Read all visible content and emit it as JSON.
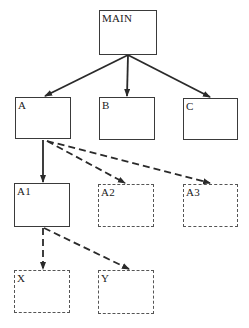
{
  "diagram": {
    "type": "hierarchy",
    "nodes": [
      {
        "id": "main",
        "label": "MAIN",
        "style": "solid",
        "x": 99,
        "y": 10,
        "w": 58,
        "h": 45
      },
      {
        "id": "a",
        "label": "A",
        "style": "solid",
        "x": 15,
        "y": 97,
        "w": 56,
        "h": 42
      },
      {
        "id": "b",
        "label": "B",
        "style": "solid",
        "x": 99,
        "y": 97,
        "w": 56,
        "h": 43
      },
      {
        "id": "c",
        "label": "C",
        "style": "solid",
        "x": 183,
        "y": 98,
        "w": 55,
        "h": 42
      },
      {
        "id": "a1",
        "label": "A1",
        "style": "solid",
        "x": 14,
        "y": 183,
        "w": 56,
        "h": 44
      },
      {
        "id": "a2",
        "label": "A2",
        "style": "dashed",
        "x": 98,
        "y": 184,
        "w": 56,
        "h": 43
      },
      {
        "id": "a3",
        "label": "A3",
        "style": "dashed",
        "x": 183,
        "y": 184,
        "w": 55,
        "h": 43
      },
      {
        "id": "x",
        "label": "X",
        "style": "dashed",
        "x": 14,
        "y": 270,
        "w": 56,
        "h": 43
      },
      {
        "id": "y",
        "label": "Y",
        "style": "dashed",
        "x": 98,
        "y": 270,
        "w": 56,
        "h": 44
      }
    ],
    "edges": [
      {
        "from": "main",
        "to": "a",
        "style": "solid"
      },
      {
        "from": "main",
        "to": "b",
        "style": "solid"
      },
      {
        "from": "main",
        "to": "c",
        "style": "solid"
      },
      {
        "from": "a",
        "to": "a1",
        "style": "solid"
      },
      {
        "from": "a",
        "to": "a2",
        "style": "dashed"
      },
      {
        "from": "a",
        "to": "a3",
        "style": "dashed"
      },
      {
        "from": "a1",
        "to": "x",
        "style": "dashed"
      },
      {
        "from": "a1",
        "to": "y",
        "style": "dashed"
      }
    ]
  },
  "labels": {
    "main": "MAIN",
    "a": "A",
    "b": "B",
    "c": "C",
    "a1": "A1",
    "a2": "A2",
    "a3": "A3",
    "x": "X",
    "y": "Y"
  },
  "colors": {
    "line": "#2a2a2a",
    "dashed_border": "#555555",
    "background": "#ffffff"
  }
}
